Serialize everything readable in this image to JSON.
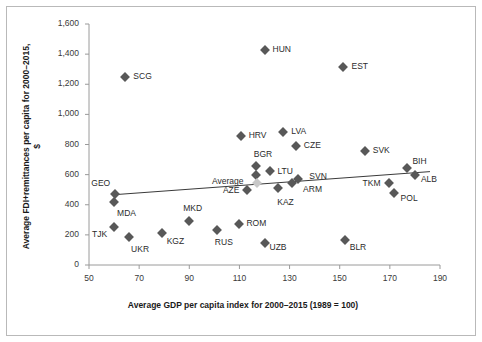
{
  "chart_data": {
    "type": "scatter",
    "title": "",
    "xlabel": "Average GDP per capita index for 2000–2015 (1989 = 100)",
    "ylabel": "Average FDI+remittances per capita for 2000–2015, $",
    "xlim": [
      50,
      190
    ],
    "ylim": [
      0,
      1600
    ],
    "xticks": [
      50,
      70,
      90,
      110,
      130,
      150,
      170,
      190
    ],
    "yticks": [
      0,
      200,
      400,
      600,
      800,
      1000,
      1200,
      1400,
      1600
    ],
    "xtick_labels": [
      "50",
      "70",
      "90",
      "110",
      "130",
      "150",
      "170",
      "190"
    ],
    "ytick_labels": [
      "0",
      "200",
      "400",
      "600",
      "800",
      "1,000",
      "1,200",
      "1,400",
      "1,600"
    ],
    "grid": false,
    "legend": "none",
    "marker_shape": "diamond",
    "marker_color": "#585858",
    "average_marker_color": "#c8c8c8",
    "trendline": {
      "label": "linear trendline",
      "x_start": 59.5,
      "y_start": 466,
      "x_end": 186,
      "y_end": 620,
      "color": "#3a3a3a"
    },
    "points": [
      {
        "code": "SCG",
        "x": 64.5,
        "y": 1245,
        "label_dx": 8,
        "label_dy": -1
      },
      {
        "code": "HUN",
        "x": 120.0,
        "y": 1430,
        "label_dx": 8,
        "label_dy": -1
      },
      {
        "code": "EST",
        "x": 151.5,
        "y": 1315,
        "label_dx": 8,
        "label_dy": -1
      },
      {
        "code": "HRV",
        "x": 110.5,
        "y": 855,
        "label_dx": 8,
        "label_dy": -1
      },
      {
        "code": "LVA",
        "x": 127.5,
        "y": 880,
        "label_dx": 8,
        "label_dy": -1
      },
      {
        "code": "CZE",
        "x": 132.5,
        "y": 790,
        "label_dx": 8,
        "label_dy": -1
      },
      {
        "code": "SVK",
        "x": 160.0,
        "y": 760,
        "label_dx": 8,
        "label_dy": -1
      },
      {
        "code": "BGR",
        "x": 116.5,
        "y": 660,
        "label_dx": -2,
        "label_dy": -12
      },
      {
        "code": "BGR2",
        "x": 116.5,
        "y": 600,
        "label_dx": 0,
        "label_dy": 0,
        "hide_label": true
      },
      {
        "code": "LTU",
        "x": 122.0,
        "y": 622,
        "label_dx": 8,
        "label_dy": 0
      },
      {
        "code": "Average",
        "x": 117.0,
        "y": 545,
        "label_dx": -45,
        "label_dy": -2,
        "is_average": true
      },
      {
        "code": "SVN",
        "x": 133.5,
        "y": 570,
        "label_dx": 11,
        "label_dy": -3
      },
      {
        "code": "ARM",
        "x": 131.0,
        "y": 545,
        "label_dx": 11,
        "label_dy": 6
      },
      {
        "code": "KAZ",
        "x": 125.5,
        "y": 510,
        "label_dx": -1,
        "label_dy": 14
      },
      {
        "code": "BIH",
        "x": 177.0,
        "y": 645,
        "label_dx": 5,
        "label_dy": -7
      },
      {
        "code": "ALB",
        "x": 180.0,
        "y": 600,
        "label_dx": 6,
        "label_dy": 4
      },
      {
        "code": "TKM",
        "x": 169.5,
        "y": 545,
        "label_dx": -26,
        "label_dy": 0
      },
      {
        "code": "POL",
        "x": 171.5,
        "y": 480,
        "label_dx": 7,
        "label_dy": 5
      },
      {
        "code": "AZE",
        "x": 113.0,
        "y": 500,
        "label_dx": -24,
        "label_dy": 0
      },
      {
        "code": "GEO",
        "x": 60.5,
        "y": 470,
        "label_dx": -24,
        "label_dy": -11
      },
      {
        "code": "MDA",
        "x": 60.0,
        "y": 415,
        "label_dx": 3,
        "label_dy": 11
      },
      {
        "code": "MKD",
        "x": 90.0,
        "y": 295,
        "label_dx": -6,
        "label_dy": -13
      },
      {
        "code": "ROM",
        "x": 110.0,
        "y": 275,
        "label_dx": 7,
        "label_dy": -1
      },
      {
        "code": "TJK",
        "x": 60.0,
        "y": 255,
        "label_dx": -22,
        "label_dy": 7
      },
      {
        "code": "RUS",
        "x": 101.0,
        "y": 235,
        "label_dx": -2,
        "label_dy": 12
      },
      {
        "code": "KGZ",
        "x": 79.0,
        "y": 215,
        "label_dx": 5,
        "label_dy": 8
      },
      {
        "code": "UKR",
        "x": 66.0,
        "y": 185,
        "label_dx": 2,
        "label_dy": 12
      },
      {
        "code": "UZB",
        "x": 120.0,
        "y": 145,
        "label_dx": 5,
        "label_dy": 4
      },
      {
        "code": "BLR",
        "x": 152.0,
        "y": 165,
        "label_dx": 5,
        "label_dy": 7
      }
    ]
  }
}
